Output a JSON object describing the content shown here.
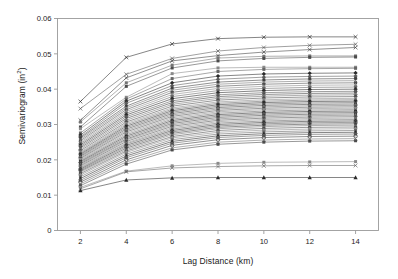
{
  "chart_data": {
    "type": "line",
    "title": "",
    "xlabel": "Lag Distance (km)",
    "ylabel_text": "Semivariogram (in",
    "ylabel_sup": "2",
    "ylabel_tail": ")",
    "x": [
      2,
      4,
      6,
      8,
      10,
      12,
      14
    ],
    "xlim": [
      1,
      15
    ],
    "ylim": [
      0,
      0.06
    ],
    "xticks": [
      "2",
      "4",
      "6",
      "8",
      "10",
      "12",
      "14"
    ],
    "yticks": [
      "0",
      "0.01",
      "0.02",
      "0.03",
      "0.04",
      "0.05",
      "0.06"
    ],
    "ytickvals": [
      0,
      0.01,
      0.02,
      0.03,
      0.04,
      0.05,
      0.06
    ],
    "grid": false,
    "legend": "none",
    "line_color": "#4a4a4a",
    "frame_color": "#9a9a9a",
    "series": [
      {
        "name": "S01",
        "marker": "x",
        "values": [
          0.0365,
          0.049,
          0.0528,
          0.0543,
          0.0547,
          0.0548,
          0.0548
        ]
      },
      {
        "name": "S02",
        "marker": "x",
        "values": [
          0.0345,
          0.0442,
          0.0487,
          0.0508,
          0.0518,
          0.0524,
          0.0527
        ]
      },
      {
        "name": "S03",
        "marker": "x",
        "values": [
          0.0312,
          0.0432,
          0.048,
          0.0495,
          0.0505,
          0.0512,
          0.0518
        ]
      },
      {
        "name": "S04",
        "marker": "square",
        "values": [
          0.0307,
          0.0418,
          0.0468,
          0.0488,
          0.0493,
          0.0494,
          0.0494
        ]
      },
      {
        "name": "S05",
        "marker": "square",
        "values": [
          0.0293,
          0.0408,
          0.046,
          0.048,
          0.0487,
          0.049,
          0.0491
        ]
      },
      {
        "name": "S06",
        "marker": "square",
        "values": [
          0.0288,
          0.0377,
          0.0444,
          0.046,
          0.0462,
          0.0462,
          0.0462
        ]
      },
      {
        "name": "S07",
        "marker": "square",
        "values": [
          0.0276,
          0.0372,
          0.043,
          0.045,
          0.0456,
          0.0458,
          0.0459
        ]
      },
      {
        "name": "S08",
        "marker": "diamond",
        "values": [
          0.027,
          0.0366,
          0.0418,
          0.0437,
          0.0443,
          0.0445,
          0.0446
        ]
      },
      {
        "name": "S09",
        "marker": "diamond",
        "values": [
          0.0265,
          0.036,
          0.041,
          0.0428,
          0.0434,
          0.0436,
          0.0437
        ]
      },
      {
        "name": "S10",
        "marker": "square",
        "values": [
          0.0262,
          0.0352,
          0.0403,
          0.042,
          0.0426,
          0.0429,
          0.043
        ]
      },
      {
        "name": "S11",
        "marker": "x",
        "values": [
          0.0258,
          0.0347,
          0.0397,
          0.0414,
          0.042,
          0.0423,
          0.0424
        ]
      },
      {
        "name": "S12",
        "marker": "square",
        "values": [
          0.0254,
          0.0342,
          0.0391,
          0.0408,
          0.0414,
          0.0417,
          0.0418
        ]
      },
      {
        "name": "S13",
        "marker": "triangle",
        "values": [
          0.025,
          0.0337,
          0.0385,
          0.0402,
          0.0408,
          0.0411,
          0.0412
        ]
      },
      {
        "name": "S14",
        "marker": "square",
        "values": [
          0.0246,
          0.0332,
          0.0379,
          0.0396,
          0.0402,
          0.0405,
          0.0406
        ]
      },
      {
        "name": "S15",
        "marker": "diamond",
        "values": [
          0.0242,
          0.0327,
          0.0373,
          0.039,
          0.0396,
          0.0399,
          0.04
        ]
      },
      {
        "name": "S16",
        "marker": "square",
        "values": [
          0.0238,
          0.0322,
          0.0367,
          0.0384,
          0.039,
          0.0393,
          0.0394
        ]
      },
      {
        "name": "S17",
        "marker": "x",
        "values": [
          0.0234,
          0.0317,
          0.0362,
          0.0379,
          0.0385,
          0.0388,
          0.0389
        ]
      },
      {
        "name": "S18",
        "marker": "square",
        "values": [
          0.023,
          0.0312,
          0.0357,
          0.0374,
          0.038,
          0.0383,
          0.0384
        ]
      },
      {
        "name": "S19",
        "marker": "diamond",
        "values": [
          0.0226,
          0.0307,
          0.0352,
          0.0369,
          0.0375,
          0.0378,
          0.0379
        ]
      },
      {
        "name": "S20",
        "marker": "square",
        "values": [
          0.0222,
          0.0303,
          0.0347,
          0.0364,
          0.037,
          0.0373,
          0.0374
        ]
      },
      {
        "name": "S21",
        "marker": "triangle",
        "values": [
          0.0219,
          0.0299,
          0.0343,
          0.036,
          0.0366,
          0.0369,
          0.037
        ]
      },
      {
        "name": "S22",
        "marker": "square",
        "values": [
          0.0216,
          0.0295,
          0.0339,
          0.0356,
          0.0362,
          0.0365,
          0.0366
        ]
      },
      {
        "name": "S23",
        "marker": "x",
        "values": [
          0.0213,
          0.0291,
          0.0335,
          0.0352,
          0.0358,
          0.0361,
          0.0362
        ]
      },
      {
        "name": "S24",
        "marker": "square",
        "values": [
          0.021,
          0.0287,
          0.0331,
          0.0348,
          0.0354,
          0.0357,
          0.0358
        ]
      },
      {
        "name": "S25",
        "marker": "diamond",
        "values": [
          0.0207,
          0.0283,
          0.0327,
          0.0344,
          0.035,
          0.0353,
          0.0354
        ]
      },
      {
        "name": "S26",
        "marker": "square",
        "values": [
          0.0204,
          0.0279,
          0.0323,
          0.034,
          0.0346,
          0.0349,
          0.035
        ]
      },
      {
        "name": "S27",
        "marker": "square",
        "values": [
          0.0201,
          0.0275,
          0.0319,
          0.0336,
          0.0342,
          0.0345,
          0.0346
        ]
      },
      {
        "name": "S28",
        "marker": "x",
        "values": [
          0.0198,
          0.0271,
          0.0315,
          0.0332,
          0.0338,
          0.0341,
          0.0342
        ]
      },
      {
        "name": "S29",
        "marker": "square",
        "values": [
          0.0195,
          0.0267,
          0.0311,
          0.0328,
          0.0334,
          0.0337,
          0.0338
        ]
      },
      {
        "name": "S30",
        "marker": "diamond",
        "values": [
          0.0192,
          0.0263,
          0.0307,
          0.0324,
          0.033,
          0.0333,
          0.0334
        ]
      },
      {
        "name": "S31",
        "marker": "square",
        "values": [
          0.0189,
          0.0259,
          0.0303,
          0.032,
          0.0326,
          0.0329,
          0.033
        ]
      },
      {
        "name": "S32",
        "marker": "triangle",
        "values": [
          0.0186,
          0.0256,
          0.0299,
          0.0316,
          0.0322,
          0.0325,
          0.0326
        ]
      },
      {
        "name": "S33",
        "marker": "square",
        "values": [
          0.0183,
          0.0252,
          0.0295,
          0.0312,
          0.0318,
          0.0321,
          0.0322
        ]
      },
      {
        "name": "S34",
        "marker": "x",
        "values": [
          0.018,
          0.0248,
          0.0291,
          0.0308,
          0.0314,
          0.0317,
          0.0318
        ]
      },
      {
        "name": "S35",
        "marker": "square",
        "values": [
          0.0177,
          0.0245,
          0.0287,
          0.0304,
          0.031,
          0.0313,
          0.0314
        ]
      },
      {
        "name": "S36",
        "marker": "diamond",
        "values": [
          0.0174,
          0.0241,
          0.0283,
          0.03,
          0.0306,
          0.0309,
          0.031
        ]
      },
      {
        "name": "S37",
        "marker": "circle",
        "values": [
          0.0171,
          0.0237,
          0.0279,
          0.0296,
          0.0302,
          0.0305,
          0.0306
        ]
      },
      {
        "name": "S38",
        "marker": "square",
        "values": [
          0.0168,
          0.0233,
          0.0275,
          0.0292,
          0.0298,
          0.0301,
          0.0302
        ]
      },
      {
        "name": "S39",
        "marker": "x",
        "values": [
          0.0165,
          0.0229,
          0.0271,
          0.0288,
          0.0294,
          0.0297,
          0.0298
        ]
      },
      {
        "name": "S40",
        "marker": "square",
        "values": [
          0.0161,
          0.0225,
          0.0266,
          0.0283,
          0.0289,
          0.0292,
          0.0293
        ]
      },
      {
        "name": "S41",
        "marker": "diamond",
        "values": [
          0.0157,
          0.0221,
          0.0262,
          0.0278,
          0.0284,
          0.0287,
          0.0288
        ]
      },
      {
        "name": "S42",
        "marker": "square",
        "values": [
          0.0152,
          0.0216,
          0.0257,
          0.0273,
          0.0279,
          0.0282,
          0.0283
        ]
      },
      {
        "name": "S43",
        "marker": "triangle",
        "values": [
          0.0147,
          0.0211,
          0.0252,
          0.0268,
          0.0274,
          0.0277,
          0.0278
        ]
      },
      {
        "name": "S44",
        "marker": "square",
        "values": [
          0.0142,
          0.0206,
          0.0247,
          0.0263,
          0.0269,
          0.0272,
          0.0273
        ]
      },
      {
        "name": "S45",
        "marker": "circle",
        "values": [
          0.0137,
          0.02,
          0.0241,
          0.0257,
          0.0263,
          0.0266,
          0.0267
        ]
      },
      {
        "name": "S46",
        "marker": "x",
        "values": [
          0.0132,
          0.0194,
          0.0234,
          0.025,
          0.0256,
          0.0259,
          0.026
        ]
      },
      {
        "name": "S47",
        "marker": "square",
        "values": [
          0.0127,
          0.0188,
          0.0228,
          0.0244,
          0.025,
          0.0253,
          0.0254
        ]
      },
      {
        "name": "S48",
        "marker": "square",
        "values": [
          0.0122,
          0.0168,
          0.0183,
          0.019,
          0.0193,
          0.0194,
          0.0195
        ]
      },
      {
        "name": "S49",
        "marker": "x",
        "values": [
          0.0118,
          0.0166,
          0.0177,
          0.0181,
          0.0183,
          0.0184,
          0.0184
        ]
      },
      {
        "name": "S50",
        "marker": "triangle",
        "values": [
          0.0113,
          0.0143,
          0.0149,
          0.015,
          0.015,
          0.015,
          0.015
        ]
      }
    ]
  }
}
